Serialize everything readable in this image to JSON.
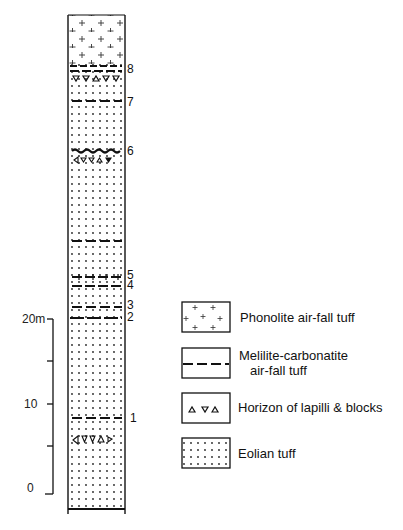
{
  "column": {
    "title": "Stratigraphic section",
    "unit_markers": [
      {
        "label": "8",
        "y": 68
      },
      {
        "label": "7",
        "y": 101
      },
      {
        "label": "6",
        "y": 151
      },
      {
        "label": "5",
        "y": 276
      },
      {
        "label": "4",
        "y": 285
      },
      {
        "label": "3",
        "y": 306
      },
      {
        "label": "2",
        "y": 318
      },
      {
        "label": "1",
        "y": 417
      }
    ]
  },
  "scale": {
    "ticks": [
      {
        "label": "20m",
        "y": 319
      },
      {
        "label": "10",
        "y": 404
      },
      {
        "label": "0",
        "y": 488
      }
    ],
    "unit": "m"
  },
  "legend": {
    "items": [
      {
        "label": "Phonolite air-fall tuff",
        "pattern": "plus-pattern"
      },
      {
        "label": "Melilite-carbonatite air-fall tuff",
        "line1": "Melilite-carbonatite",
        "line2": "air-fall tuff",
        "pattern": "dashed-line-pattern"
      },
      {
        "label": "Horizon of lapilli & blocks",
        "pattern": "triangle-pattern"
      },
      {
        "label": "Eolian tuff",
        "pattern": "dot-pattern"
      }
    ]
  },
  "colors": {
    "ink": "#111111",
    "background": "#ffffff"
  }
}
